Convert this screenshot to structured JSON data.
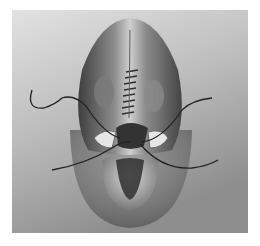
{
  "image": {
    "description": "Grayscale surgical illustration showing a sutured midline incision with needle and thread",
    "colors": {
      "background_light": "#d9d9d9",
      "background_dark": "#8a8a8a",
      "tissue_dark": "#3a3a3a",
      "tissue_mid": "#6e6e6e",
      "highlight": "#e8e8e8",
      "thread": "#2a2a2a"
    }
  }
}
